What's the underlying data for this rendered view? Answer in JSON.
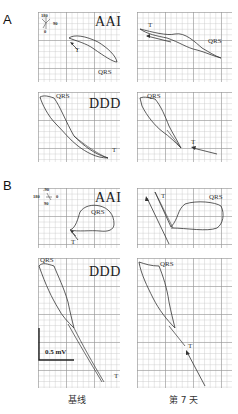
{
  "figure": {
    "panel_a": {
      "letter": "A",
      "axis_legend": {
        "top": "180",
        "right": "90",
        "bottom": "0"
      },
      "rows": [
        {
          "mode": "AAI",
          "left_labels": {
            "qrs": "QRS",
            "t": "T"
          },
          "right_labels": {
            "qrs": "QRS",
            "t": "T"
          }
        },
        {
          "mode": "DDD",
          "left_labels": {
            "qrs": "QRS",
            "t": "T"
          },
          "right_labels": {
            "qrs": "QRS",
            "t": "T"
          }
        }
      ]
    },
    "panel_b": {
      "letter": "B",
      "axis_legend": {
        "top": "-90",
        "left": "180",
        "right": "0",
        "bottom": "90"
      },
      "rows": [
        {
          "mode": "AAI",
          "left_labels": {
            "qrs": "QRS",
            "t": "T"
          },
          "right_labels": {
            "qrs": "QRS",
            "t": "T"
          }
        },
        {
          "mode": "DDD",
          "left_labels": {
            "qrs": "QRS",
            "t": "T"
          },
          "right_labels": {
            "qrs": "QRS",
            "t": "T"
          }
        }
      ],
      "scale_bar": "0.5 mV"
    },
    "column_captions": [
      "基线",
      "第 7 天"
    ],
    "colors": {
      "trace": "#333333",
      "grid_major": "#969696",
      "grid_minor": "#c8c8c8"
    }
  }
}
